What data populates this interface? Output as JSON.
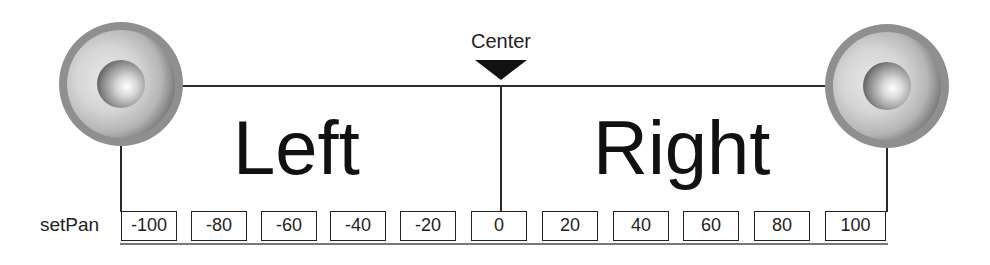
{
  "diagram": {
    "center_label": "Center",
    "left_label": "Left",
    "right_label": "Right",
    "row_label": "setPan",
    "speakers": [
      {
        "id": "left",
        "icon": "speaker-icon"
      },
      {
        "id": "right",
        "icon": "speaker-icon"
      }
    ],
    "pan_values": [
      "-100",
      "-80",
      "-60",
      "-40",
      "-20",
      "0",
      "20",
      "40",
      "60",
      "80",
      "100"
    ],
    "colors": {
      "line": "#2a2a2a",
      "marker": "#111111",
      "speaker_rim": "#8f8f8f",
      "box_border": "#222222",
      "background": "#ffffff"
    }
  }
}
